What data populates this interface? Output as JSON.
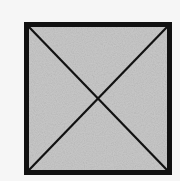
{
  "diagram": {
    "shape": "square",
    "description": "Square with both diagonals drawn, forming an X",
    "square": {
      "x": 24,
      "y": 22,
      "width": 148,
      "height": 153
    },
    "border_width": 5,
    "diagonal_width": 2.2,
    "colors": {
      "background": "#f6f6f6",
      "fill": "#c9c9c9",
      "stroke": "#111111"
    },
    "diagonals": [
      {
        "from": "top-left",
        "to": "bottom-right"
      },
      {
        "from": "top-right",
        "to": "bottom-left"
      }
    ]
  }
}
